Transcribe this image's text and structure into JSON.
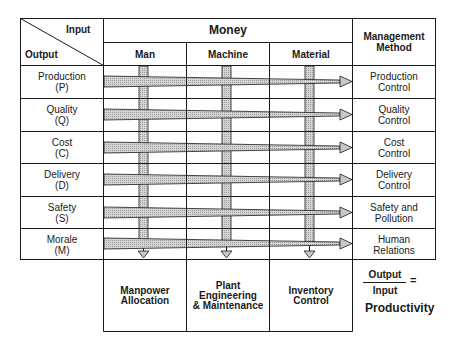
{
  "header": {
    "corner_input": "Input",
    "corner_output": "Output",
    "money": "Money",
    "management_method": "Management Method",
    "inputs": [
      "Man",
      "Machine",
      "Material"
    ]
  },
  "rows": [
    {
      "output": "Production",
      "code": "(P)",
      "method_line1": "Production",
      "method_line2": "Control"
    },
    {
      "output": "Quality",
      "code": "(Q)",
      "method_line1": "Quality",
      "method_line2": "Control"
    },
    {
      "output": "Cost",
      "code": "(C)",
      "method_line1": "Cost",
      "method_line2": "Control"
    },
    {
      "output": "Delivery",
      "code": "(D)",
      "method_line1": "Delivery",
      "method_line2": "Control"
    },
    {
      "output": "Safety",
      "code": "(S)",
      "method_line1": "Safety and",
      "method_line2": "Pollution"
    },
    {
      "output": "Morale",
      "code": "(M)",
      "method_line1": "Human",
      "method_line2": "Relations"
    }
  ],
  "bottom": {
    "man": [
      "Manpower",
      "Allocation"
    ],
    "machine": [
      "Plant",
      "Engineering",
      "& Maintenance"
    ],
    "material": [
      "Inventory",
      "Control"
    ]
  },
  "formula": {
    "numerator": "Output",
    "denominator": "Input",
    "equals": "=",
    "result": "Productivity"
  },
  "colors": {
    "line": "#1a1a1a",
    "arrow_fill": "#c8c8c8"
  }
}
